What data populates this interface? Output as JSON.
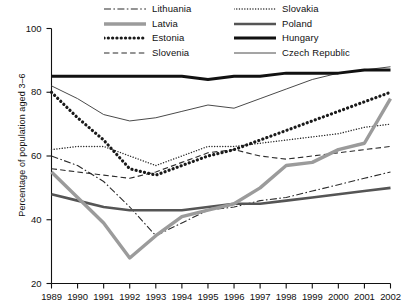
{
  "chart_data": {
    "type": "line",
    "title": "",
    "xlabel": "",
    "ylabel": "Percentage of population aged 3–6",
    "x": [
      1989,
      1990,
      1991,
      1992,
      1993,
      1994,
      1995,
      1996,
      1997,
      1998,
      1999,
      2000,
      2001,
      2002
    ],
    "xlim": [
      1989,
      2002
    ],
    "ylim": [
      20,
      100
    ],
    "yticks": [
      20,
      40,
      60,
      80,
      100
    ],
    "grid": false,
    "legend_position": "top-center",
    "series": [
      {
        "name": "Lithuania",
        "style": "dash-dot",
        "color": "#2b2b2b",
        "values": [
          60,
          57,
          52,
          44,
          35,
          39,
          43,
          44,
          46,
          47,
          49,
          51,
          53,
          55
        ]
      },
      {
        "name": "Latvia",
        "style": "solid-thick-gray",
        "color": "#9b9b9b",
        "values": [
          55,
          47,
          39,
          28,
          35,
          41,
          43,
          45,
          50,
          57,
          58,
          62,
          64,
          78
        ]
      },
      {
        "name": "Estonia",
        "style": "dotted-bold",
        "color": "#1a1a1a",
        "values": [
          80,
          72,
          65,
          56,
          54,
          57,
          60,
          62,
          65,
          68,
          71,
          74,
          77,
          80
        ]
      },
      {
        "name": "Slovenia",
        "style": "dashed",
        "color": "#2b2b2b",
        "values": [
          56,
          55,
          54,
          53,
          55,
          58,
          61,
          62,
          60,
          59,
          60,
          61,
          62,
          63
        ]
      },
      {
        "name": "Slovakia",
        "style": "dotted-fine",
        "color": "#2b2b2b",
        "values": [
          62,
          63,
          63,
          60,
          57,
          60,
          63,
          63,
          64,
          65,
          66,
          67,
          69,
          70
        ]
      },
      {
        "name": "Poland",
        "style": "solid-medium-gray",
        "color": "#555555",
        "values": [
          48,
          46,
          44,
          43,
          43,
          43,
          44,
          45,
          45,
          46,
          47,
          48,
          49,
          50
        ]
      },
      {
        "name": "Hungary",
        "style": "solid-thick-black",
        "color": "#111111",
        "values": [
          85,
          85,
          85,
          85,
          85,
          85,
          84,
          85,
          85,
          86,
          86,
          86,
          87,
          87
        ]
      },
      {
        "name": "Czech Republic",
        "style": "solid-thin",
        "color": "#4a4a4a",
        "values": [
          82,
          78,
          73,
          71,
          72,
          74,
          76,
          75,
          78,
          81,
          84,
          86,
          87,
          88
        ]
      }
    ],
    "legend_entries": [
      {
        "label": "Lithuania",
        "style": "dash-dot",
        "color": "#2b2b2b"
      },
      {
        "label": "Latvia",
        "style": "solid-thick-gray",
        "color": "#9b9b9b"
      },
      {
        "label": "Estonia",
        "style": "dotted-bold",
        "color": "#1a1a1a"
      },
      {
        "label": "Slovenia",
        "style": "dashed",
        "color": "#2b2b2b"
      },
      {
        "label": "Slovakia",
        "style": "dotted-fine",
        "color": "#2b2b2b"
      },
      {
        "label": "Poland",
        "style": "solid-medium-gray",
        "color": "#555555"
      },
      {
        "label": "Hungary",
        "style": "solid-thick-black",
        "color": "#111111"
      },
      {
        "label": "Czech Republic",
        "style": "solid-thin",
        "color": "#4a4a4a"
      }
    ],
    "ytick_labels": [
      "100",
      "80",
      "60",
      "40",
      "20"
    ],
    "xtick_labels": [
      "1989",
      "1990",
      "1991",
      "1992",
      "1993",
      "1994",
      "1995",
      "1996",
      "1997",
      "1998",
      "1999",
      "2000",
      "2001",
      "2002"
    ]
  }
}
